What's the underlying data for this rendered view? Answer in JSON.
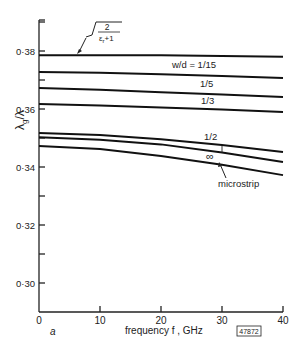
{
  "chart_data": {
    "type": "line",
    "title": "",
    "xlabel": "frequency f, GHz",
    "ylabel": "λg/λ",
    "xlim": [
      0,
      40
    ],
    "ylim": [
      0.29,
      0.392
    ],
    "x_ticks": [
      0,
      10,
      20,
      30,
      40
    ],
    "x_tick_labels": [
      "0",
      "10",
      "20",
      "30",
      "40"
    ],
    "y_ticks": [
      0.3,
      0.32,
      0.34,
      0.36,
      0.38
    ],
    "y_tick_labels": [
      "0·30",
      "0·32",
      "0·34",
      "0·36",
      "0·38"
    ],
    "y_minor_ticks": [
      0.31,
      0.33,
      0.35,
      0.37,
      0.39
    ],
    "grid": false,
    "x": [
      0,
      10,
      20,
      30,
      40
    ],
    "series": [
      {
        "name": "sqrt(2/(εr+1))",
        "label": "√(2/(εr+1))",
        "values": [
          0.3785,
          0.3785,
          0.3785,
          0.3783,
          0.378
        ]
      },
      {
        "name": "w/d = 1/15",
        "label": "w/d = 1/15",
        "values": [
          0.3728,
          0.3725,
          0.372,
          0.3714,
          0.3707
        ]
      },
      {
        "name": "w/d = 1/5",
        "label": "1/5",
        "values": [
          0.3672,
          0.3666,
          0.3658,
          0.365,
          0.3641
        ]
      },
      {
        "name": "w/d = 1/3",
        "label": "1/3",
        "values": [
          0.3617,
          0.3612,
          0.3605,
          0.3598,
          0.359
        ]
      },
      {
        "name": "w/d = 1/2",
        "label": "1/2",
        "values": [
          0.3517,
          0.351,
          0.3496,
          0.3476,
          0.3452
        ]
      },
      {
        "name": "w/d = ∞",
        "label": "∞",
        "values": [
          0.3503,
          0.3494,
          0.3478,
          0.345,
          0.3417
        ]
      },
      {
        "name": "microstrip",
        "label": "microstrip",
        "values": [
          0.3472,
          0.3462,
          0.3438,
          0.3408,
          0.3372
        ]
      }
    ],
    "annotations": [
      {
        "text": "√(2/(εr+1))",
        "points_to": "top asymptote line"
      },
      {
        "text": "w/d = 1/15"
      },
      {
        "text": "1/5"
      },
      {
        "text": "1/3"
      },
      {
        "text": "1/2"
      },
      {
        "text": "∞"
      },
      {
        "text": "microstrip",
        "points_to": "lowest curve"
      },
      {
        "text": "a",
        "position": "below x-axis origin"
      },
      {
        "text": "47872",
        "position": "figure reference box, bottom right"
      }
    ],
    "legend": "inline labels"
  },
  "labels": {
    "ylabel": "λg/λ",
    "ylabel_main": "λ",
    "ylabel_sub": "g",
    "ylabel_rest": "/λ",
    "xlabel": "frequency  f , GHz",
    "panel": "a",
    "figure_ref": "47872",
    "sqrt_num": "2",
    "sqrt_den": "ε",
    "sqrt_den_sub": "r",
    "sqrt_den_rest": "+1",
    "wd_1_15": "w/d = 1/15",
    "wd_1_5": "1/5",
    "wd_1_3": "1/3",
    "wd_1_2": "1/2",
    "wd_inf": "∞",
    "microstrip": "microstrip"
  }
}
